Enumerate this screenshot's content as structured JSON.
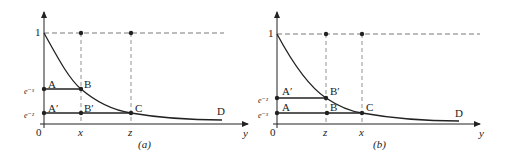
{
  "panels": [
    {
      "caption": "(a)",
      "y_axis_top_label": "1",
      "origin_label": "0",
      "x_axis_label": "y",
      "upper_level_label": "e⁻ˣ",
      "lower_level_label": "e⁻ᶻ",
      "tick_labels": [
        "x",
        "z"
      ],
      "points": {
        "A": "A",
        "B": "B",
        "A_prime": "A′",
        "B_prime": "B′",
        "C": "C",
        "D": "D"
      }
    },
    {
      "caption": "(b)",
      "y_axis_top_label": "1",
      "origin_label": "0",
      "x_axis_label": "y",
      "upper_level_label": "e⁻ᶻ",
      "lower_level_label": "e⁻ˣ",
      "tick_labels": [
        "z",
        "x"
      ],
      "points": {
        "A_prime": "A′",
        "B_prime": "B′",
        "A": "A",
        "B": "B",
        "C": "C",
        "D": "D"
      }
    }
  ]
}
